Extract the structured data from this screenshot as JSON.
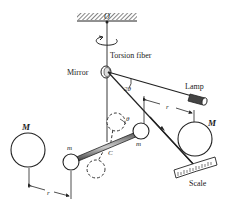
{
  "diagram": {
    "labels": {
      "pivot": "O",
      "fiber": "Torsion fiber",
      "mirror": "Mirror",
      "lamp": "Lamp",
      "angle_reflect": "2θ",
      "angle_rot": "θ",
      "distance_upper": "r",
      "distance_lower": "r",
      "big_mass_left": "M",
      "big_mass_right": "M",
      "small_mass_left": "m",
      "small_mass_right": "m",
      "center": "C",
      "scale": "Scale"
    },
    "colors": {
      "ink": "#222222",
      "background": "#ffffff"
    }
  }
}
